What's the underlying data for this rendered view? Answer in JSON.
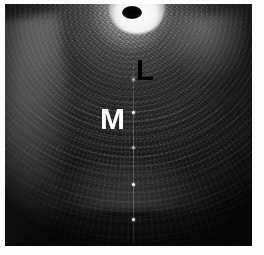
{
  "figure": {
    "name": "ultrasound-scan",
    "modality": "grayscale ultrasound B-mode sector scan",
    "border_color": "#ffffff",
    "background_color": "#050505"
  },
  "annotations": [
    {
      "id": "L",
      "text": "L",
      "color": "#000000",
      "meaning": "lumen",
      "x": 131,
      "y": 52
    },
    {
      "id": "M",
      "text": "M",
      "color": "#ffffff",
      "meaning": "muscularis",
      "x": 95,
      "y": 100
    }
  ],
  "markers": {
    "name": "depth-marker-dots",
    "color": "#f4f4f4",
    "positions_y": [
      75,
      108,
      143,
      180,
      215
    ],
    "line_x": 128
  },
  "features": {
    "transducer_core_label": "transducer-core",
    "halo_label": "concentric-echo-halo",
    "left_streak_label": "bright-wall-streak",
    "grid_label": "radial-scanline-grid"
  }
}
